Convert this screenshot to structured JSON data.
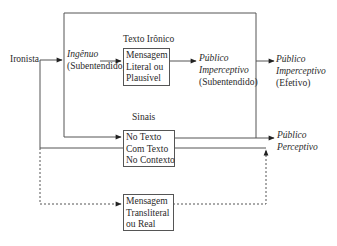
{
  "diagram": {
    "source_node": {
      "label": "Ironista"
    },
    "naive": {
      "line1": "Ingênuo",
      "line2": "(Subentendido)"
    },
    "ironic_text": {
      "title": "Texto Irônico",
      "box_lines": [
        "Mensagem",
        "Literal ou",
        "Plausível"
      ]
    },
    "implied_audience": {
      "line1": "Público",
      "line2": "Imperceptivo",
      "line3": "(Subentendido)"
    },
    "actual_audience": {
      "line1": "Público",
      "line2": "Imperceptivo",
      "line3": "(Efetivo)"
    },
    "signals": {
      "title": "Sinais",
      "box_lines": [
        "No Texto",
        "Com Texto",
        "No Contexto"
      ]
    },
    "perceptive_audience": {
      "line1": "Público",
      "line2": "Perceptivo"
    },
    "transliteral": {
      "box_lines": [
        "Mensagem",
        "Transliteral",
        "ou Real"
      ]
    },
    "colors": {
      "line": "#555555",
      "text": "#2a2a2a"
    }
  }
}
